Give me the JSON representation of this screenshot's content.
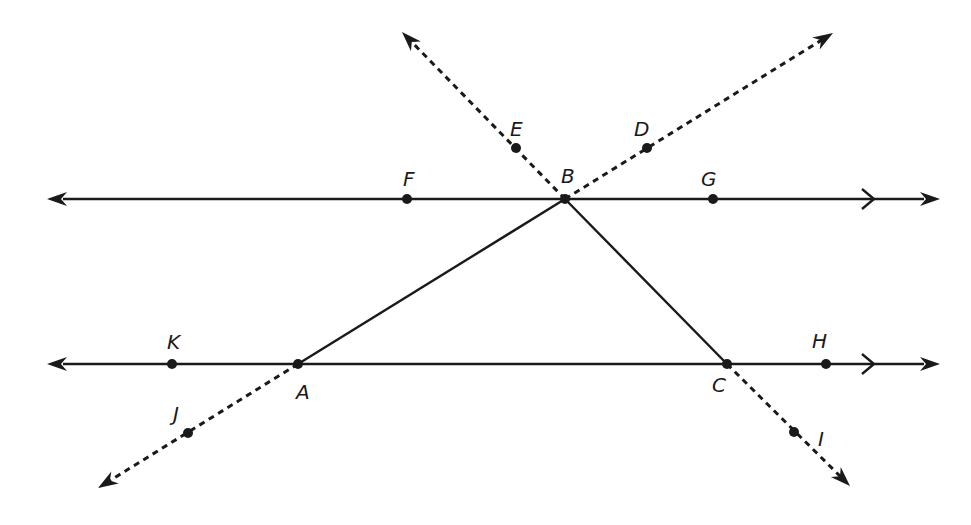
{
  "diagram": {
    "colors": {
      "stroke": "#1a1a1a",
      "background": "#ffffff"
    },
    "lines": {
      "top": {
        "y": 199,
        "x1": 47,
        "x2": 940,
        "parallel_mark_x": 870
      },
      "bottom": {
        "y": 364,
        "x1": 47,
        "x2": 940,
        "parallel_mark_x": 870
      }
    },
    "triangle": [
      "A",
      "B",
      "C"
    ],
    "points": {
      "A": {
        "label": "A",
        "x": 298,
        "y": 364,
        "lx": 296,
        "ly": 399
      },
      "B": {
        "label": "B",
        "x": 565,
        "y": 199,
        "lx": 561,
        "ly": 183
      },
      "C": {
        "label": "C",
        "x": 727,
        "y": 364,
        "lx": 712,
        "ly": 392
      },
      "D": {
        "label": "D",
        "x": 647,
        "y": 148,
        "lx": 634,
        "ly": 136
      },
      "E": {
        "label": "E",
        "x": 516,
        "y": 148,
        "lx": 510,
        "ly": 136
      },
      "F": {
        "label": "F",
        "x": 407,
        "y": 199,
        "lx": 403,
        "ly": 186
      },
      "G": {
        "label": "G",
        "x": 713,
        "y": 199,
        "lx": 701,
        "ly": 186
      },
      "H": {
        "label": "H",
        "x": 826,
        "y": 364,
        "lx": 812,
        "ly": 348
      },
      "I": {
        "label": "I",
        "x": 794,
        "y": 432,
        "lx": 818,
        "ly": 446
      },
      "J": {
        "label": "J",
        "x": 188,
        "y": 433,
        "lx": 173,
        "ly": 421
      },
      "K": {
        "label": "K",
        "x": 172,
        "y": 364,
        "lx": 167,
        "ly": 349
      }
    },
    "dashed_rays": [
      {
        "name": "ray-BE",
        "from": "B",
        "to_x": 402,
        "to_y": 32
      },
      {
        "name": "ray-BD",
        "from": "B",
        "to_x": 833,
        "to_y": 33
      },
      {
        "name": "ray-AJ",
        "from": "A",
        "to_x": 98,
        "to_y": 488
      },
      {
        "name": "ray-CI",
        "from": "C",
        "to_x": 850,
        "to_y": 486
      }
    ]
  }
}
